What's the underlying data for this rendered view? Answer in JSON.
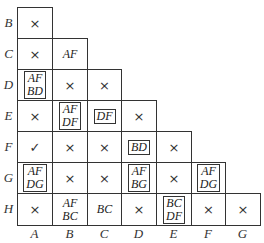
{
  "row_labels": [
    "B",
    "C",
    "D",
    "E",
    "F",
    "G",
    "H"
  ],
  "col_labels": [
    "A",
    "B",
    "C",
    "D",
    "E",
    "F",
    "G"
  ],
  "cells": {
    "B-A": {
      "text": "×",
      "type": "mark",
      "boxed": false
    },
    "C-A": {
      "text": "×",
      "type": "mark",
      "boxed": false
    },
    "C-B": {
      "text": "AF",
      "type": "text",
      "boxed": false
    },
    "D-A": {
      "text": "AF\nBD",
      "type": "text",
      "boxed": true
    },
    "D-B": {
      "text": "×",
      "type": "mark",
      "boxed": false
    },
    "D-C": {
      "text": "×",
      "type": "mark",
      "boxed": false
    },
    "E-A": {
      "text": "×",
      "type": "mark",
      "boxed": false
    },
    "E-B": {
      "text": "AF\nDF",
      "type": "text",
      "boxed": true
    },
    "E-C": {
      "text": "DF",
      "type": "text",
      "boxed": true
    },
    "E-D": {
      "text": "×",
      "type": "mark",
      "boxed": false
    },
    "F-A": {
      "text": "✓",
      "type": "mark",
      "boxed": false
    },
    "F-B": {
      "text": "×",
      "type": "mark",
      "boxed": false
    },
    "F-C": {
      "text": "×",
      "type": "mark",
      "boxed": false
    },
    "F-D": {
      "text": "BD",
      "type": "text",
      "boxed": true
    },
    "F-E": {
      "text": "×",
      "type": "mark",
      "boxed": false
    },
    "G-A": {
      "text": "AF\nDG",
      "type": "text",
      "boxed": true
    },
    "G-B": {
      "text": "×",
      "type": "mark",
      "boxed": false
    },
    "G-C": {
      "text": "×",
      "type": "mark",
      "boxed": false
    },
    "G-D": {
      "text": "AF\nBG",
      "type": "text",
      "boxed": true
    },
    "G-E": {
      "text": "×",
      "type": "mark",
      "boxed": false
    },
    "G-F": {
      "text": "AF\nDG",
      "type": "text",
      "boxed": true
    },
    "H-A": {
      "text": "×",
      "type": "mark",
      "boxed": false
    },
    "H-B": {
      "text": "AF\nBC",
      "type": "text",
      "boxed": false
    },
    "H-C": {
      "text": "BC",
      "type": "text",
      "boxed": false
    },
    "H-D": {
      "text": "×",
      "type": "mark",
      "boxed": false
    },
    "H-E": {
      "text": "BC\nDF",
      "type": "text",
      "boxed": true
    },
    "H-F": {
      "text": "×",
      "type": "mark",
      "boxed": false
    },
    "H-G": {
      "text": "×",
      "type": "mark",
      "boxed": false
    }
  }
}
